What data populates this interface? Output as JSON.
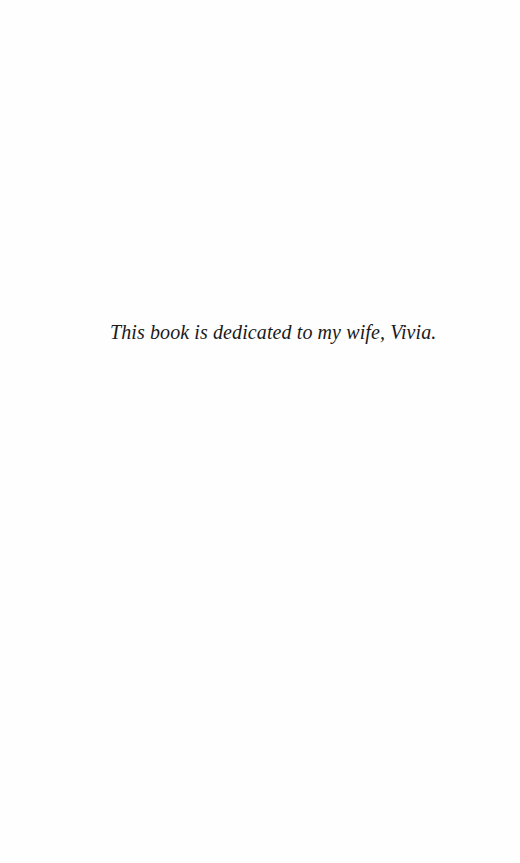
{
  "page": {
    "background": "#fefefe",
    "dedication": {
      "text": "This book is dedicated to my wife, Vivia.",
      "color": "#1a1a1a"
    }
  }
}
